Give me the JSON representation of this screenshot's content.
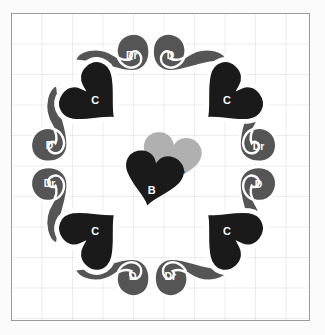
{
  "figure": {
    "kind": "radial-symmetry-diagram",
    "background_color": "#ffffff",
    "page_color": "#fbfbfb",
    "border_color": "#9a9a9a",
    "grid_color": "#e6e6ea",
    "grid_spacing_px": 30.5
  },
  "palette": {
    "dark": "#1a1a1a",
    "mid_gray": "#555555",
    "light_gray": "#b0b0b0",
    "label_on_dark": "#ffffff",
    "label_on_light": "#1a1a1a"
  },
  "center": {
    "hearts": [
      {
        "id": "A",
        "label": "A",
        "fill": "#b0b0b0",
        "text_color": "#1a1a1a",
        "layer": "back"
      },
      {
        "id": "B",
        "label": "B",
        "fill": "#1a1a1a",
        "text_color": "#ffffff",
        "layer": "front"
      }
    ]
  },
  "ring": {
    "count": 12,
    "hearts": [
      {
        "id": "C-top-left",
        "label": "C",
        "fill": "#1a1a1a",
        "text_color": "#ffffff",
        "angle_deg": 300
      },
      {
        "id": "C-top-right",
        "label": "C",
        "fill": "#1a1a1a",
        "text_color": "#ffffff",
        "angle_deg": 60
      },
      {
        "id": "C-bottom-right",
        "label": "C",
        "fill": "#1a1a1a",
        "text_color": "#ffffff",
        "angle_deg": 120
      },
      {
        "id": "C-bottom-left",
        "label": "C",
        "fill": "#1a1a1a",
        "text_color": "#ffffff",
        "angle_deg": 240
      }
    ],
    "commas": [
      {
        "id": "Dr-top",
        "label": "Dr",
        "fill": "#555555",
        "text_color": "#ffffff",
        "mirrored": true,
        "position": "top-left-of-apex"
      },
      {
        "id": "D-top",
        "label": "D",
        "fill": "#555555",
        "text_color": "#ffffff",
        "mirrored": false,
        "position": "top-right-of-apex"
      },
      {
        "id": "Dr-right-upper",
        "label": "Dr",
        "fill": "#555555",
        "text_color": "#ffffff",
        "mirrored": true,
        "position": "right-upper"
      },
      {
        "id": "D-right-lower",
        "label": "D",
        "fill": "#555555",
        "text_color": "#ffffff",
        "mirrored": false,
        "position": "right-lower"
      },
      {
        "id": "Dr-bottom-right",
        "label": "Dr",
        "fill": "#555555",
        "text_color": "#ffffff",
        "mirrored": true,
        "position": "bottom-right-of-base"
      },
      {
        "id": "D-bottom-left",
        "label": "D",
        "fill": "#555555",
        "text_color": "#ffffff",
        "mirrored": false,
        "position": "bottom-left-of-base"
      },
      {
        "id": "Dr-left-lower",
        "label": "Dr",
        "fill": "#555555",
        "text_color": "#ffffff",
        "mirrored": true,
        "position": "left-lower"
      },
      {
        "id": "D-left-upper",
        "label": "D",
        "fill": "#555555",
        "text_color": "#ffffff",
        "mirrored": false,
        "position": "left-upper"
      }
    ]
  }
}
